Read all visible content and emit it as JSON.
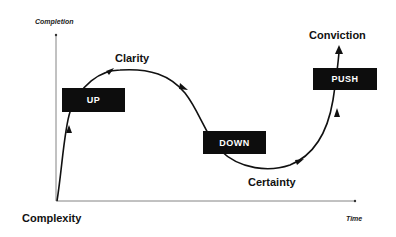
{
  "diagram": {
    "y_axis_label": "Completion",
    "x_axis_label": "Time",
    "origin_label": "Complexity",
    "stages": {
      "clarity": "Clarity",
      "certainty": "Certainty",
      "conviction": "Conviction"
    },
    "phases": {
      "up": "UP",
      "down": "DOWN",
      "push": "PUSH"
    },
    "colors": {
      "box_fill": "#0d0d0d",
      "box_text": "#ffffff",
      "line": "#111111",
      "axis": "#555555"
    }
  }
}
